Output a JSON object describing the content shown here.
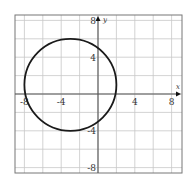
{
  "chart_data": {
    "type": "line",
    "title": "",
    "xlabel": "x",
    "ylabel": "y",
    "xlim": [
      -9,
      9
    ],
    "ylim": [
      -9,
      9
    ],
    "grid": true,
    "grid_step": 2,
    "x_tick_labels": [
      {
        "value": -8,
        "label": "-8"
      },
      {
        "value": -4,
        "label": "-4"
      },
      {
        "value": 4,
        "label": "4"
      },
      {
        "value": 8,
        "label": "8"
      }
    ],
    "y_tick_labels": [
      {
        "value": 8,
        "label": "8"
      },
      {
        "value": 4,
        "label": "4"
      },
      {
        "value": -4,
        "label": "-4"
      },
      {
        "value": -8,
        "label": "-8"
      }
    ],
    "series": [
      {
        "name": "circle",
        "shape": "circle",
        "center": [
          -3,
          1
        ],
        "radius": 5,
        "equation": "(x + 3)^2 + (y - 1)^2 = 25"
      }
    ],
    "legend": null
  },
  "colors": {
    "background": "#ffffff",
    "grid": "#c8c8c8",
    "frame": "#777777",
    "axis": "#555555",
    "curve": "#1a1a1a"
  }
}
